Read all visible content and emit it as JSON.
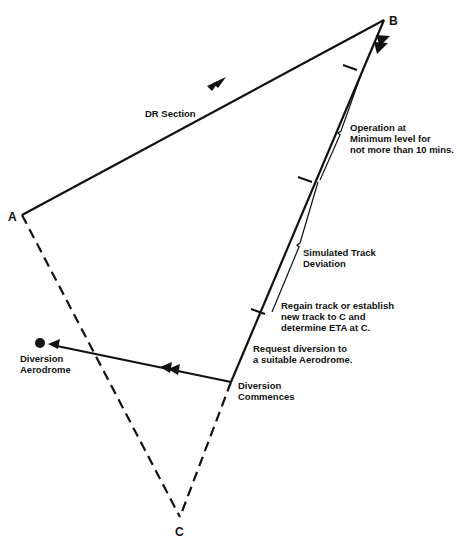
{
  "points": {
    "A": {
      "label": "A"
    },
    "B": {
      "label": "B"
    },
    "C": {
      "label": "C"
    }
  },
  "labels": {
    "dr_section": "DR Section",
    "operation": [
      "Operation at",
      "Minimum level for",
      "not more than 10 mins."
    ],
    "simulated": [
      "Simulated Track",
      "Deviation"
    ],
    "regain": [
      "Regain track or establish",
      "new track to C and",
      "determine ETA at C."
    ],
    "request": [
      "Request diversion to",
      "a suitable Aerodrome."
    ],
    "diversion_commences": [
      "Diversion",
      "Commences"
    ],
    "diversion_aerodrome": [
      "Diversion",
      "Aerodrome"
    ]
  },
  "colors": {
    "line": "#111111",
    "background": "#ffffff"
  }
}
